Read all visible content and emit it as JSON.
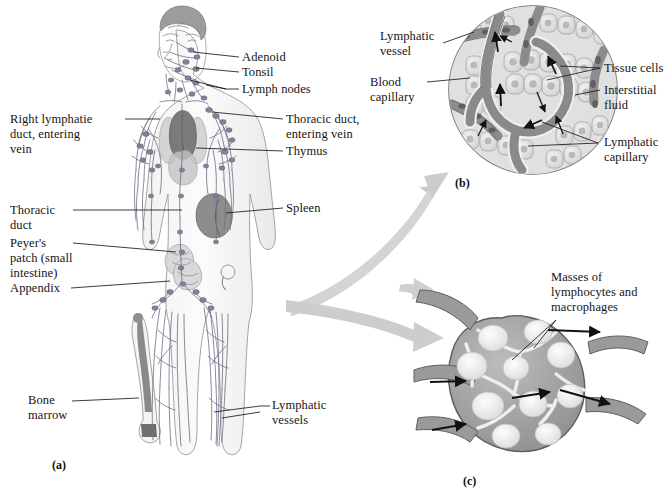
{
  "figure": {
    "background_color": "#ffffff",
    "ink_color": "#151515",
    "arrow_color": "#c8c8c8",
    "panels": [
      {
        "tag": "(a)",
        "name": "whole-body-lymphatic-system"
      },
      {
        "tag": "(b)",
        "name": "lymphatic-capillary-detail"
      },
      {
        "tag": "(c)",
        "name": "lymph-node-cross-section"
      }
    ]
  },
  "panel_a": {
    "tag": "(a)",
    "labels_right": [
      {
        "key": "adenoid",
        "text": "Adenoid"
      },
      {
        "key": "tonsil",
        "text": "Tonsil"
      },
      {
        "key": "lymph_nodes",
        "text": "Lymph nodes"
      },
      {
        "key": "thoracic_duct_vein",
        "text": "Thoracic duct,\nentering vein"
      },
      {
        "key": "thymus",
        "text": "Thymus"
      },
      {
        "key": "spleen",
        "text": "Spleen"
      },
      {
        "key": "lymphatic_vessels",
        "text": "Lymphatic\nvessels"
      }
    ],
    "labels_left": [
      {
        "key": "right_lymphatic_duct",
        "text": "Right lymphatie\nduct, entering\nvein"
      },
      {
        "key": "thoracic_duct",
        "text": "Thoracic\nduct"
      },
      {
        "key": "peyers_patch",
        "text": "Peyer's\npatch (small\nintestine)"
      },
      {
        "key": "appendix",
        "text": "Appendix"
      },
      {
        "key": "bone_marrow",
        "text": "Bone\nmarrow"
      }
    ]
  },
  "panel_b": {
    "tag": "(b)",
    "labels": [
      {
        "key": "lymphatic_vessel",
        "text": "Lymphatic\nvessel"
      },
      {
        "key": "blood_capillary",
        "text": "Blood\ncapillary"
      },
      {
        "key": "tissue_cells",
        "text": "Tissue cells"
      },
      {
        "key": "interstitial_fluid",
        "text": "Interstitial\nfluid"
      },
      {
        "key": "lymphatic_capillary",
        "text": "Lymphatic\ncapillary"
      }
    ]
  },
  "panel_c": {
    "tag": "(c)",
    "labels": [
      {
        "key": "masses",
        "text": "Masses of\nlymphocytes and\nmacrophages"
      }
    ]
  }
}
